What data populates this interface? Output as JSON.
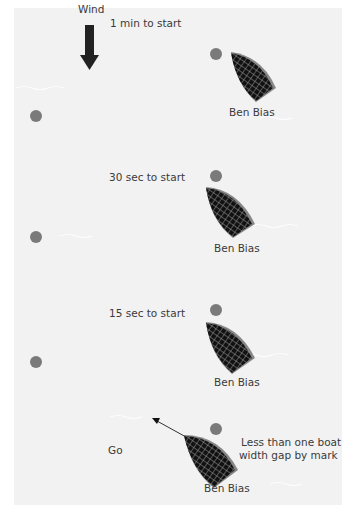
{
  "wind": {
    "label": "Wind",
    "direction": "down"
  },
  "stages": [
    {
      "time_label": "1 min to start",
      "boat_label": "Ben Bias"
    },
    {
      "time_label": "30 sec to start",
      "boat_label": "Ben Bias"
    },
    {
      "time_label": "15 sec to start",
      "boat_label": "Ben Bias"
    },
    {
      "time_label": "Go",
      "boat_label": "Ben Bias",
      "note_line1": "Less than one boat",
      "note_line2": "width gap by mark"
    }
  ],
  "colors": {
    "panel": "#f2f2f2",
    "mark": "#7a7a7a",
    "boat_hull": "#1a1a1a",
    "boat_edge": "#808080"
  }
}
